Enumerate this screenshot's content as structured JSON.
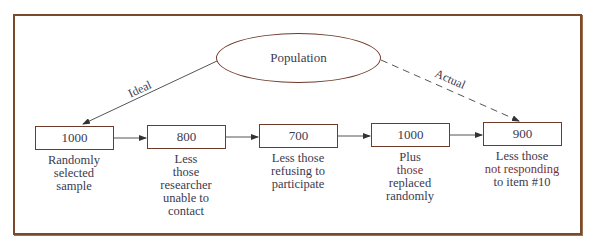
{
  "diagram": {
    "type": "flowchart",
    "root": {
      "label": "Population"
    },
    "edges": [
      {
        "from": "Population",
        "to": "box1",
        "label": "Ideal",
        "style": "solid"
      },
      {
        "from": "Population",
        "to": "box5",
        "label": "Actual",
        "style": "dashed"
      }
    ],
    "boxes": [
      {
        "id": "box1",
        "value": "1000",
        "caption_lines": [
          "Randomly",
          "selected",
          "sample"
        ]
      },
      {
        "id": "box2",
        "value": "800",
        "caption_lines": [
          "Less",
          "those",
          "researcher",
          "unable to",
          "contact"
        ]
      },
      {
        "id": "box3",
        "value": "700",
        "caption_lines": [
          "Less those",
          "refusing to",
          "participate"
        ]
      },
      {
        "id": "box4",
        "value": "1000",
        "caption_lines": [
          "Plus",
          "those",
          "replaced",
          "randomly"
        ]
      },
      {
        "id": "box5",
        "value": "900",
        "caption_lines": [
          "Less those",
          "not responding",
          "to item #10"
        ]
      }
    ],
    "colors": {
      "frame": "#7b4a2c",
      "shape_border": "#6e3a2a",
      "text": "#3a3a50",
      "arrow": "#444444"
    }
  }
}
